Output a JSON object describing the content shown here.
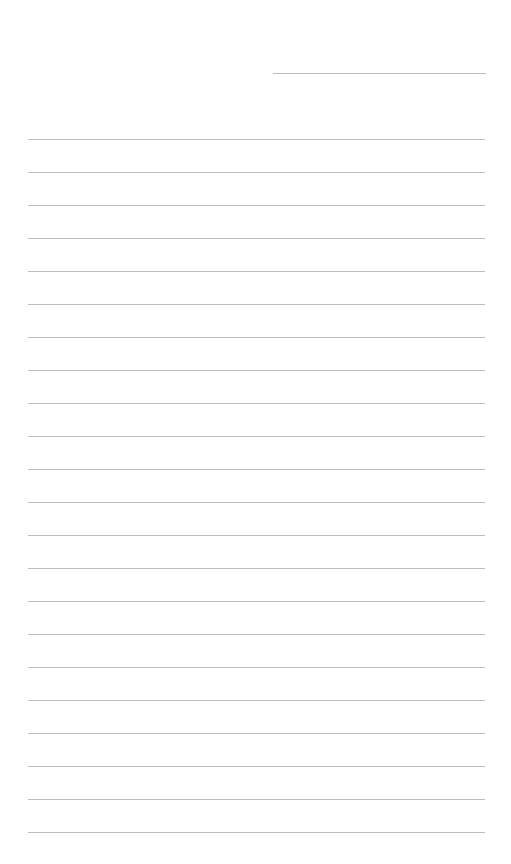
{
  "page": {
    "type": "lined-paper",
    "background_color": "#ffffff",
    "line_color": "#bdbdbd",
    "header_line": {
      "label": "",
      "x": 273,
      "y": 73,
      "width": 213
    },
    "lines": {
      "count": 22,
      "start_y": 139,
      "spacing": 33,
      "x": 28,
      "width": 457
    },
    "text": []
  }
}
